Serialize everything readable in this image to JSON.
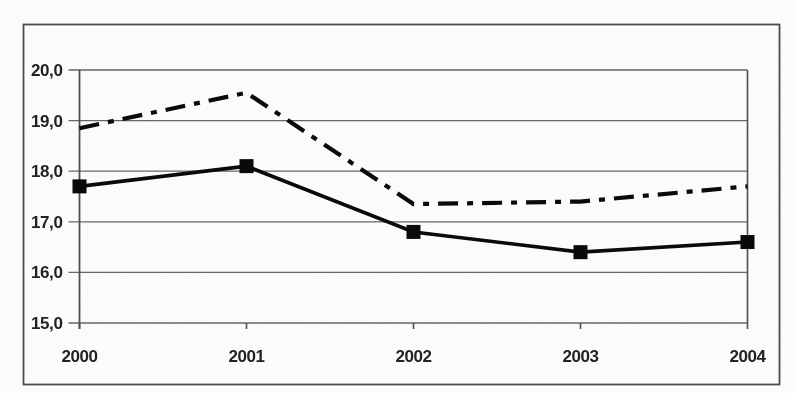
{
  "chart_data": {
    "type": "line",
    "title": "",
    "xlabel": "",
    "ylabel": "",
    "x": [
      "2000",
      "2001",
      "2002",
      "2003",
      "2004"
    ],
    "xtick_labels": [
      "2000",
      "2001",
      "2002",
      "2003",
      "2004"
    ],
    "ylim": [
      15.0,
      20.0
    ],
    "ytick_step": 1.0,
    "ytick_labels": [
      "20,0",
      "19,0",
      "18,0",
      "17,0",
      "16,0",
      "15,0"
    ],
    "decimal_separator": ",",
    "grid": true,
    "legend": "none",
    "series": [
      {
        "name": "upper-dash-dot-line",
        "style": "dash-dot",
        "marker": "none",
        "color": "#0a0a0a",
        "values": [
          18.85,
          19.55,
          17.35,
          17.4,
          17.7
        ]
      },
      {
        "name": "lower-solid-line-square-markers",
        "style": "solid",
        "marker": "square",
        "color": "#0a0a0a",
        "values": [
          17.7,
          18.1,
          16.8,
          16.4,
          16.6
        ]
      }
    ]
  },
  "colors": {
    "paper": "#fdfdfc",
    "frame": "#4d4d4d",
    "gridline": "#666666",
    "axis": "#4f4f4f",
    "series": "#0a0a0a",
    "tick_text": "#222222"
  }
}
